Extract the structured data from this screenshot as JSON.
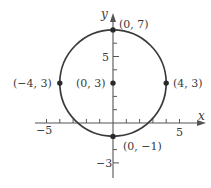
{
  "figure": {
    "type": "circle-graph",
    "equation_center": [
      0,
      3
    ],
    "radius": 4,
    "axes": {
      "x_label": "x",
      "y_label": "y",
      "x_tick_labels": [
        {
          "value": -5,
          "text": "−5"
        },
        {
          "value": 5,
          "text": "5"
        }
      ],
      "y_tick_labels": [
        {
          "value": 5,
          "text": "5"
        },
        {
          "value": -3,
          "text": "−3"
        }
      ],
      "x_range": [
        -5.5,
        7
      ],
      "y_range": [
        -4,
        8
      ]
    },
    "points": [
      {
        "name": "top",
        "coords": [
          0,
          7
        ],
        "label": "(0, 7)"
      },
      {
        "name": "left",
        "coords": [
          -4,
          3
        ],
        "label": "(−4, 3)"
      },
      {
        "name": "center",
        "coords": [
          0,
          3
        ],
        "label": "(0, 3)"
      },
      {
        "name": "right",
        "coords": [
          4,
          3
        ],
        "label": "(4, 3)"
      },
      {
        "name": "bottom",
        "coords": [
          0,
          -1
        ],
        "label": "(0, −1)"
      }
    ],
    "colors": {
      "curve": "#3a3a3a",
      "axis": "#555555",
      "text": "#3a3a3a"
    }
  }
}
